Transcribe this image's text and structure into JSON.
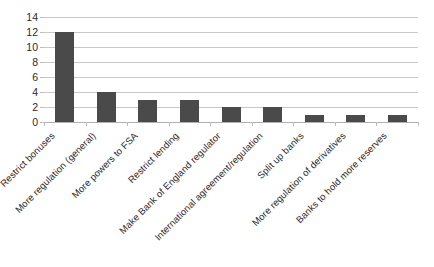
{
  "chart_data": {
    "type": "bar",
    "title": "",
    "subtitle": "",
    "xlabel": "",
    "ylabel": "",
    "ylim": [
      0,
      14
    ],
    "ytick_values": [
      0,
      2,
      4,
      6,
      8,
      10,
      12,
      14
    ],
    "ytick_labels": [
      "0",
      "2",
      "4",
      "6",
      "8",
      "10",
      "12",
      "14"
    ],
    "grid": true,
    "legend": false,
    "legend_position": "none",
    "orientation": "vertical",
    "bar_color": "#4a4a4a",
    "gridline_color": "#c9c9c9",
    "axis_color": "#bdbdbd",
    "background_color": "#ffffff",
    "xtick_label_rotation": -45,
    "categories": [
      "Restrict bonuses",
      "More regulation (general)",
      "More powers to FSA",
      "Restrict lending",
      "Make Bank of England regulator",
      "International agreement/regulation",
      "Split up banks",
      "More regulation of derivatives",
      "Banks to hold more reserves"
    ],
    "values": [
      12,
      4,
      3,
      3,
      2,
      2,
      1,
      1,
      1
    ],
    "series": [
      {
        "name": "",
        "values": [
          12,
          4,
          3,
          3,
          2,
          2,
          1,
          1,
          1
        ]
      }
    ]
  }
}
